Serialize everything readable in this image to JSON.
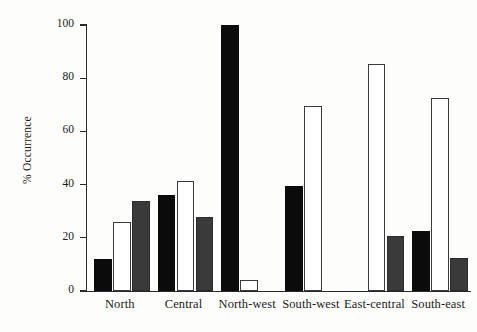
{
  "chart_data": {
    "type": "bar",
    "title": "",
    "xlabel": "",
    "ylabel": "% Occurrence",
    "ylim": [
      0,
      100
    ],
    "yticks": [
      0,
      20,
      40,
      60,
      80,
      100
    ],
    "grid": false,
    "legend": "none",
    "categories": [
      "North",
      "Central",
      "North-west",
      "South-west",
      "East-central",
      "South-east"
    ],
    "series": [
      {
        "name": "series-1",
        "fill": "black",
        "color": "#0b0b0b",
        "values": [
          12,
          36,
          100,
          39.5,
          0,
          22.5
        ]
      },
      {
        "name": "series-2",
        "fill": "white",
        "color": "#ffffff",
        "values": [
          26,
          41.5,
          4,
          69.5,
          85.5,
          72.5
        ]
      },
      {
        "name": "series-3",
        "fill": "gray",
        "color": "#3a3a3a",
        "values": [
          34,
          28,
          0,
          0,
          20.5,
          12.5
        ]
      }
    ]
  },
  "axis": {
    "y_title": "% Occurrence",
    "y_tick_labels": [
      "0",
      "20",
      "40",
      "60",
      "80",
      "100"
    ],
    "x_tick_labels": [
      "North",
      "Central",
      "North-west",
      "South-west",
      "East-central",
      "South-east"
    ]
  }
}
